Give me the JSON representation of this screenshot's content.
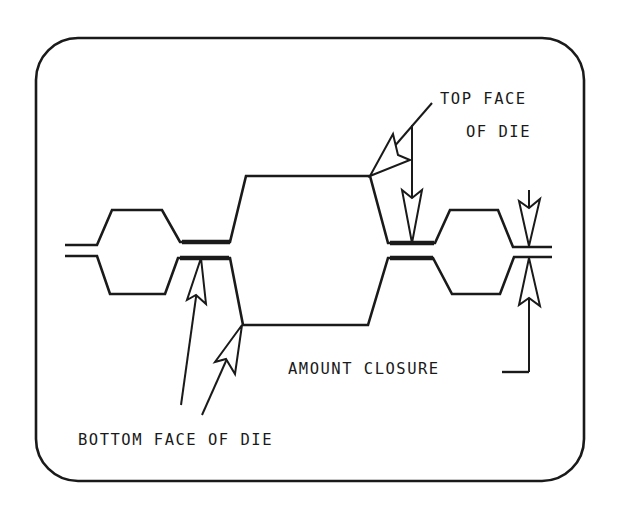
{
  "diagram": {
    "labels": {
      "top_face_line1": "TOP FACE",
      "top_face_line2": "OF DIE",
      "amount_closure": "AMOUNT CLOSURE",
      "bottom_face": "BOTTOM FACE OF DIE"
    },
    "colors": {
      "ink": "#1a1a1a",
      "background": "#ffffff"
    }
  }
}
